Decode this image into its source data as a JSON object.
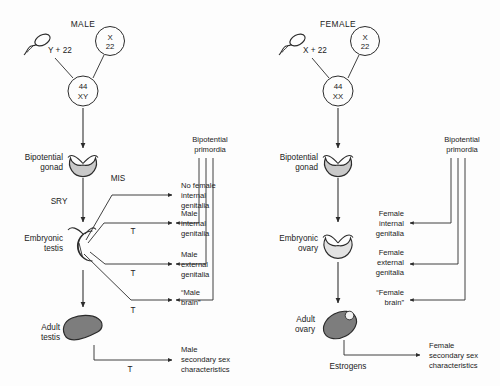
{
  "diagram": {
    "colors": {
      "stroke": "#2b2b2b",
      "gonad_fill": "#c9c9c9",
      "embryonic_testis_fill": "#d8d8d8",
      "embryonic_ovary_fill": "#e2e2e2",
      "adult_gonad_fill": "#7d7d7d",
      "background": "#fdfdfd",
      "text": "#1b1b1b"
    },
    "panels": [
      {
        "id": "male",
        "heading": "MALE",
        "gametes": {
          "sperm": {
            "icon": "sperm-icon",
            "label": "Y + 22"
          },
          "egg": {
            "icon": "egg-circle-icon",
            "line1": "X",
            "line2": "22"
          }
        },
        "zygote": {
          "line1": "44",
          "line2": "XY"
        },
        "stages": [
          {
            "id": "bipotential-gonad",
            "line1": "Bipotential",
            "line2": "gonad",
            "shape": "notched-disc"
          },
          {
            "id": "embryonic-testis",
            "line1": "Embryonic",
            "line2": "testis",
            "shape": "crescent-hook"
          },
          {
            "id": "adult-testis",
            "line1": "Adult",
            "line2": "testis",
            "shape": "teardrop"
          }
        ],
        "signals": [
          {
            "id": "sry",
            "label": "SRY"
          },
          {
            "id": "mis",
            "label": "MIS"
          },
          {
            "id": "t-internal",
            "label": "T"
          },
          {
            "id": "t-external",
            "label": "T"
          },
          {
            "id": "t-brain",
            "label": "T"
          },
          {
            "id": "t-secondary",
            "label": "T"
          }
        ],
        "outcomes": [
          {
            "id": "no-female-internal-genitalia",
            "lines": [
              "No female",
              "internal",
              "genitalia"
            ]
          },
          {
            "id": "male-internal-genitalia",
            "lines": [
              "Male",
              "internal",
              "genitalia"
            ]
          },
          {
            "id": "male-external-genitalia",
            "lines": [
              "Male",
              "external",
              "genitalia"
            ]
          },
          {
            "id": "male-brain",
            "lines": [
              "“Male",
              "brain”"
            ]
          },
          {
            "id": "male-secondary-sex-characteristics",
            "lines": [
              "Male",
              "secondary sex",
              "characteristics"
            ]
          }
        ],
        "primordia": {
          "line1": "Bipotential",
          "line2": "primordia"
        }
      },
      {
        "id": "female",
        "heading": "FEMALE",
        "gametes": {
          "sperm": {
            "icon": "sperm-icon",
            "label": "X + 22"
          },
          "egg": {
            "icon": "egg-circle-icon",
            "line1": "X",
            "line2": "22"
          }
        },
        "zygote": {
          "line1": "44",
          "line2": "XX"
        },
        "stages": [
          {
            "id": "bipotential-gonad",
            "line1": "Bipotential",
            "line2": "gonad",
            "shape": "notched-disc"
          },
          {
            "id": "embryonic-ovary",
            "line1": "Embryonic",
            "line2": "ovary",
            "shape": "notched-disc-light"
          },
          {
            "id": "adult-ovary",
            "line1": "Adult",
            "line2": "ovary",
            "shape": "tilted-ellipse-follicle"
          }
        ],
        "signals": [
          {
            "id": "estrogens",
            "label": "Estrogens"
          }
        ],
        "outcomes": [
          {
            "id": "female-internal-genitalia",
            "lines": [
              "Female",
              "internal",
              "genitalia"
            ]
          },
          {
            "id": "female-external-genitalia",
            "lines": [
              "Female",
              "external",
              "genitalia"
            ]
          },
          {
            "id": "female-brain",
            "lines": [
              "“Female",
              "brain”"
            ]
          },
          {
            "id": "female-secondary-sex-characteristics",
            "lines": [
              "Female",
              "secondary sex",
              "characteristics"
            ]
          }
        ],
        "primordia": {
          "line1": "Bipotential",
          "line2": "primordia"
        }
      }
    ]
  }
}
